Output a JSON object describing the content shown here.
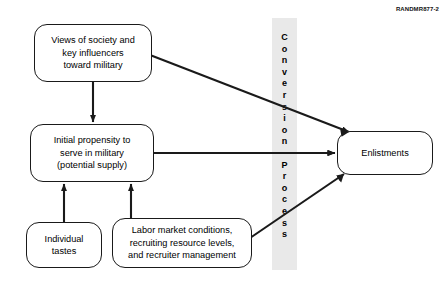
{
  "figure": {
    "id_label": "RANDMR877-2",
    "band": {
      "label": "Conversion Process",
      "letters": [
        "C",
        "o",
        "n",
        "v",
        "e",
        "r",
        "s",
        "i",
        "o",
        "n",
        "",
        "P",
        "r",
        "o",
        "c",
        "e",
        "s",
        "s"
      ],
      "color": "#e9e9e9"
    },
    "nodes": [
      {
        "id": "views",
        "text": "Views of society and key influencers toward military"
      },
      {
        "id": "propensity",
        "text": "Initial propensity to serve in military (potential supply)"
      },
      {
        "id": "tastes",
        "text": "Individual tastes"
      },
      {
        "id": "labor",
        "text": "Labor market conditions, recruiting resource levels, and recruiter management"
      },
      {
        "id": "enlist",
        "text": "Enlistments"
      }
    ],
    "node_lines": {
      "views": [
        "Views of society and",
        "key influencers",
        "toward military"
      ],
      "propensity": [
        "Initial propensity to",
        "serve in military",
        "(potential supply)"
      ],
      "tastes": [
        "Individual",
        "tastes"
      ],
      "labor": [
        "Labor market conditions,",
        "recruiting resource levels,",
        "and recruiter management"
      ],
      "enlist": [
        "Enlistments"
      ]
    },
    "edges": [
      {
        "from": "views",
        "to": "propensity",
        "style": "vertical-down"
      },
      {
        "from": "views",
        "to": "enlist",
        "style": "diagonal-down-right"
      },
      {
        "from": "propensity",
        "to": "enlist",
        "style": "horizontal-right"
      },
      {
        "from": "tastes",
        "to": "propensity",
        "style": "vertical-up"
      },
      {
        "from": "labor",
        "to": "propensity",
        "style": "vertical-up"
      },
      {
        "from": "labor",
        "to": "enlist",
        "style": "diagonal-up-right"
      }
    ],
    "colors": {
      "line": "#1a1a1a",
      "background": "#ffffff",
      "text": "#000000"
    }
  }
}
